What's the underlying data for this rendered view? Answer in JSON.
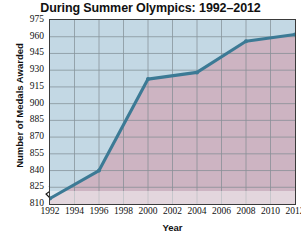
{
  "chart_data": {
    "type": "line",
    "title": "During Summer Olympics: 1992–2012",
    "xlabel": "Year",
    "ylabel": "Number of Medals Awarded",
    "x": [
      1992,
      1994,
      1996,
      1998,
      2000,
      2002,
      2004,
      2006,
      2008,
      2010,
      2012
    ],
    "xticklabels": [
      "1992",
      "1994",
      "1996",
      "1998",
      "2000",
      "2002",
      "2004",
      "2006",
      "2008",
      "2010",
      "2012"
    ],
    "xlim": [
      1992,
      2012
    ],
    "ylim": [
      810,
      975
    ],
    "yticks": [
      810,
      825,
      840,
      855,
      870,
      885,
      900,
      915,
      930,
      945,
      960,
      975
    ],
    "yticklabels": [
      "810",
      "825",
      "840",
      "855",
      "870",
      "885",
      "900",
      "915",
      "930",
      "945",
      "960",
      "975"
    ],
    "grid": true,
    "legend": "none",
    "axis_break": true,
    "series": [
      {
        "name": "Medals Awarded",
        "points": [
          {
            "x": 1992,
            "y": 815
          },
          {
            "x": 1996,
            "y": 840
          },
          {
            "x": 2000,
            "y": 922
          },
          {
            "x": 2004,
            "y": 928
          },
          {
            "x": 2008,
            "y": 956
          },
          {
            "x": 2012,
            "y": 962
          }
        ],
        "line_color": "#3c7a95",
        "marker": "dot",
        "fill_below": "#cdb4c2",
        "fill_above": "#c3d8e4"
      }
    ],
    "colors": {
      "line": "#3c7a95",
      "area_below": "#cdb4c2",
      "area_above": "#c3d8e4",
      "grid": "#7e8a91",
      "frame": "#3a3a3a",
      "text": "#111111",
      "background": "#ffffff"
    }
  }
}
